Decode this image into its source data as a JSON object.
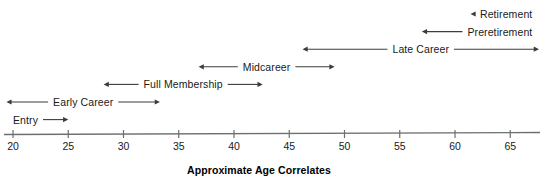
{
  "chart_data": {
    "type": "table",
    "title": "",
    "xlabel": "Approximate Age Correlates",
    "ylabel": "",
    "xlim": [
      20,
      67
    ],
    "grid": false,
    "legend": "none",
    "axis": {
      "caption": "Approximate Age Correlates",
      "ticks": [
        {
          "label": "20",
          "value": 20
        },
        {
          "label": "25",
          "value": 25
        },
        {
          "label": "30",
          "value": 30
        },
        {
          "label": "35",
          "value": 35
        },
        {
          "label": "40",
          "value": 40
        },
        {
          "label": "45",
          "value": 45
        },
        {
          "label": "50",
          "value": 50
        },
        {
          "label": "55",
          "value": 55
        },
        {
          "label": "60",
          "value": 60
        },
        {
          "label": "65",
          "value": 65
        }
      ]
    },
    "stages": [
      {
        "name": "Retirement",
        "label": "Retirement",
        "row": 0,
        "start_age": 61.4,
        "end_age": 67,
        "arrow_left": true,
        "arrow_right": false,
        "label_side": "right"
      },
      {
        "name": "Preretirement",
        "label": "Preretirement",
        "row": 1,
        "start_age": 57.0,
        "end_age": 67,
        "arrow_left": true,
        "arrow_right": false,
        "label_side": "right"
      },
      {
        "name": "Late Career",
        "label": "Late Career",
        "row": 2,
        "start_age": 46.2,
        "end_age": 67.6,
        "arrow_left": true,
        "arrow_right": true,
        "label_side": "center"
      },
      {
        "name": "Midcareer",
        "label": "Midcareer",
        "row": 3,
        "start_age": 36.8,
        "end_age": 49.1,
        "arrow_left": true,
        "arrow_right": true,
        "label_side": "center"
      },
      {
        "name": "Full Membership",
        "label": "Full Membership",
        "row": 4,
        "start_age": 28.2,
        "end_age": 42.6,
        "arrow_left": true,
        "arrow_right": true,
        "label_side": "center"
      },
      {
        "name": "Early Career",
        "label": "Early Career",
        "row": 5,
        "start_age": 19.4,
        "end_age": 33.3,
        "arrow_left": true,
        "arrow_right": true,
        "label_side": "center"
      },
      {
        "name": "Entry",
        "label": "Entry",
        "row": 6,
        "start_age": 20.0,
        "end_age": 25.0,
        "arrow_left": false,
        "arrow_right": true,
        "label_side": "left"
      }
    ]
  },
  "colors": {
    "line": "#3c3c3c",
    "axis": "#6e6e6e",
    "text": "#1a1a1a"
  }
}
